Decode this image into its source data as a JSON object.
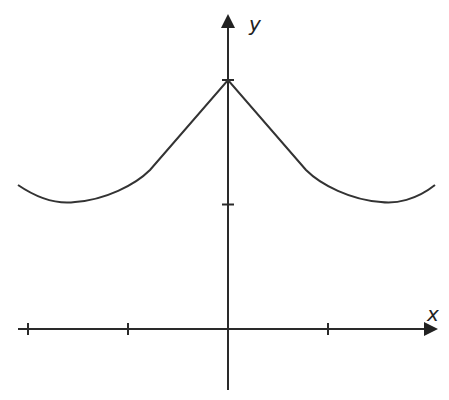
{
  "chart_data": {
    "type": "line",
    "title": "",
    "xlabel": "x",
    "ylabel": "y",
    "grid": false,
    "legend": null,
    "x_ticks": [
      -2,
      -1,
      1
    ],
    "y_ticks": [
      1,
      2
    ],
    "tick_labels_shown": false,
    "series": [
      {
        "name": "f(x)",
        "description": "Even function with a cusp peak at x=0 (y=2), minima near x=±1.55 (y≈0.99), rising toward ±2.05",
        "x": [
          -2.05,
          -1.8,
          -1.55,
          -1.2,
          -0.8,
          -0.4,
          0,
          0.4,
          0.8,
          1.2,
          1.55,
          1.8,
          2.05
        ],
        "y": [
          1.16,
          1.02,
          0.99,
          1.1,
          1.38,
          1.68,
          2.0,
          1.68,
          1.38,
          1.1,
          0.99,
          1.02,
          1.16
        ]
      }
    ]
  },
  "labels": {
    "x_axis": "x",
    "y_axis": "y"
  },
  "colors": {
    "line": "#333333",
    "axis": "#2a2a2a",
    "background": "#ffffff"
  }
}
